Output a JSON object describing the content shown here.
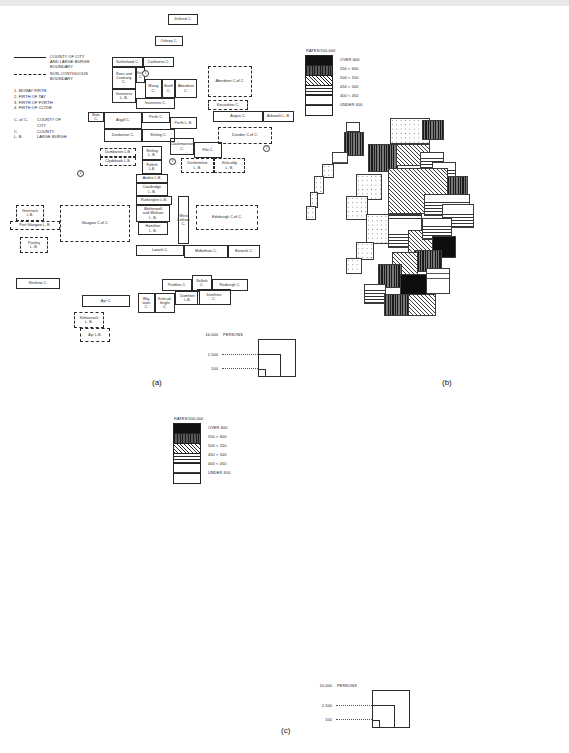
{
  "figure": {
    "panels": [
      {
        "id": "a",
        "caption": "(a)"
      },
      {
        "id": "b",
        "caption": "(b)"
      },
      {
        "id": "c",
        "caption": "(c)"
      }
    ]
  },
  "legend_boundaries": {
    "rows": [
      {
        "style": "solid",
        "text": "COUNTY OF CITY\nAND LARGE BURGH\nBOUNDARY"
      },
      {
        "style": "dashed",
        "text": "NON-CONTIGUOUS\nBOUNDARY"
      }
    ],
    "numbered": [
      "1. MORAY FIRTH",
      "2. FIRTH OF TAY",
      "3. FIRTH OF FORTH",
      "4. FIRTH OF CLYDE"
    ],
    "abbreviations": [
      {
        "abbr": "C. of C.",
        "meaning": "COUNTY OF\nCITY"
      },
      {
        "abbr": "C.",
        "meaning": "COUNTY."
      },
      {
        "abbr": "L. B.",
        "meaning": "LARGE BURGH"
      }
    ]
  },
  "rates_legend": {
    "title": "RATES/100,000",
    "classes": [
      {
        "label": "OVER 600",
        "pattern": "solid-black",
        "swatch_class": "p-over600"
      },
      {
        "label": "550 < 600",
        "pattern": "dense-vertical",
        "swatch_class": "p-550"
      },
      {
        "label": "500 < 550",
        "pattern": "diagonal-hatch",
        "swatch_class": "p-500"
      },
      {
        "label": "450 < 500",
        "pattern": "horizontal-lines",
        "swatch_class": "p-450"
      },
      {
        "label": "400 < 450",
        "pattern": "sparse-horizontal",
        "swatch_class": "p-400"
      },
      {
        "label": "UNDER 400",
        "pattern": "stipple-dots",
        "swatch_class": "p-under"
      }
    ]
  },
  "persons_scale": {
    "labels": [
      "10,000",
      "2,500",
      "100"
    ],
    "unit": "PERSONS"
  },
  "miles_scale": {
    "min": "0",
    "max": "30",
    "unit": "MILES"
  },
  "counties": [
    {
      "name": "Zetland C.",
      "x": 168,
      "y": 14,
      "w": 30,
      "h": 11,
      "style": "solid"
    },
    {
      "name": "Orkney C.",
      "x": 155,
      "y": 36,
      "w": 28,
      "h": 10,
      "style": "solid"
    },
    {
      "name": "Sutherland C.",
      "x": 112,
      "y": 57,
      "w": 31,
      "h": 10,
      "style": "solid"
    },
    {
      "name": "Caithness C.",
      "x": 143,
      "y": 57,
      "w": 31,
      "h": 10,
      "style": "solid"
    },
    {
      "name": "Ross and\nCromarty\nC.",
      "x": 112,
      "y": 67,
      "w": 24,
      "h": 22,
      "style": "solid"
    },
    {
      "name": "Inverness\nL. B.",
      "x": 112,
      "y": 89,
      "w": 24,
      "h": 14,
      "style": "solid"
    },
    {
      "name": "Nairn\nC.",
      "x": 136,
      "y": 67,
      "w": 9,
      "h": 16,
      "style": "solid"
    },
    {
      "name": "Moray\nC.",
      "x": 145,
      "y": 79,
      "w": 17,
      "h": 19,
      "style": "solid"
    },
    {
      "name": "Banff\nC.",
      "x": 162,
      "y": 79,
      "w": 13,
      "h": 19,
      "style": "solid"
    },
    {
      "name": "Aberdeen\nC.",
      "x": 175,
      "y": 79,
      "w": 22,
      "h": 19,
      "style": "solid"
    },
    {
      "name": "Aberdeen C.of C.",
      "x": 208,
      "y": 66,
      "w": 44,
      "h": 31,
      "style": "dashed"
    },
    {
      "name": "Inverness C.",
      "x": 136,
      "y": 98,
      "w": 39,
      "h": 11,
      "style": "solid"
    },
    {
      "name": "Kincardine  C.",
      "x": 208,
      "y": 100,
      "w": 40,
      "h": 10,
      "style": "dashed"
    },
    {
      "name": "Bute C.",
      "x": 88,
      "y": 112,
      "w": 16,
      "h": 10,
      "style": "solid"
    },
    {
      "name": "Argyll C.",
      "x": 104,
      "y": 112,
      "w": 38,
      "h": 17,
      "style": "solid"
    },
    {
      "name": "Perth C.",
      "x": 142,
      "y": 112,
      "w": 28,
      "h": 11,
      "style": "solid"
    },
    {
      "name": "Perth L. B.",
      "x": 170,
      "y": 117,
      "w": 27,
      "h": 12,
      "style": "solid"
    },
    {
      "name": "Angus  C.",
      "x": 213,
      "y": 111,
      "w": 50,
      "h": 11,
      "style": "solid"
    },
    {
      "name": "Arbroath L. B.",
      "x": 263,
      "y": 111,
      "w": 31,
      "h": 11,
      "style": "solid"
    },
    {
      "name": "Dundee  C.of C.",
      "x": 218,
      "y": 127,
      "w": 54,
      "h": 17,
      "style": "dashed"
    },
    {
      "name": "Stirling C.",
      "x": 142,
      "y": 129,
      "w": 33,
      "h": 13,
      "style": "solid"
    },
    {
      "name": "Dunbarton C.",
      "x": 104,
      "y": 129,
      "w": 38,
      "h": 13,
      "style": "solid"
    },
    {
      "name": "Clackmannan\nC.",
      "x": 170,
      "y": 138,
      "w": 24,
      "h": 17,
      "style": "solid"
    },
    {
      "name": "Fife C.",
      "x": 194,
      "y": 142,
      "w": 28,
      "h": 16,
      "style": "solid"
    },
    {
      "name": "Dumbarton L.B.",
      "x": 100,
      "y": 148,
      "w": 36,
      "h": 9,
      "style": "dashed"
    },
    {
      "name": "Stirling\nL. B.",
      "x": 142,
      "y": 146,
      "w": 20,
      "h": 14,
      "style": "solid"
    },
    {
      "name": "Clydebank L.B.",
      "x": 100,
      "y": 157,
      "w": 36,
      "h": 9,
      "style": "dashed"
    },
    {
      "name": "Falkirk\nL.B.",
      "x": 142,
      "y": 160,
      "w": 20,
      "h": 14,
      "style": "solid"
    },
    {
      "name": "Dunfermline\nL. B.",
      "x": 181,
      "y": 158,
      "w": 33,
      "h": 15,
      "style": "dashed"
    },
    {
      "name": "Kirkcaldy\nL. B.",
      "x": 214,
      "y": 158,
      "w": 31,
      "h": 15,
      "style": "dashed"
    },
    {
      "name": "Airdrie L.B.",
      "x": 136,
      "y": 174,
      "w": 32,
      "h": 9,
      "style": "solid"
    },
    {
      "name": "Coatbridge\nL. B.",
      "x": 136,
      "y": 183,
      "w": 32,
      "h": 13,
      "style": "solid"
    },
    {
      "name": "Rutherglen L.B.",
      "x": 136,
      "y": 196,
      "w": 36,
      "h": 9,
      "style": "solid"
    },
    {
      "name": "Motherwell\nand Wishaw\nL. B.",
      "x": 136,
      "y": 205,
      "w": 34,
      "h": 17,
      "style": "solid"
    },
    {
      "name": "Hamilton\nL. B.",
      "x": 138,
      "y": 222,
      "w": 30,
      "h": 13,
      "style": "solid"
    },
    {
      "name": "Greenock\nL.B.",
      "x": 16,
      "y": 205,
      "w": 28,
      "h": 16,
      "style": "dashed"
    },
    {
      "name": "Port Glasgow L. B.",
      "x": 10,
      "y": 221,
      "w": 50,
      "h": 9,
      "style": "dashed"
    },
    {
      "name": "Paisley\nL. B.",
      "x": 20,
      "y": 237,
      "w": 28,
      "h": 16,
      "style": "dashed"
    },
    {
      "name": "Glasgow C.of C.",
      "x": 60,
      "y": 205,
      "w": 70,
      "h": 37,
      "style": "dashed"
    },
    {
      "name": "Edinburgh C.of C.",
      "x": 196,
      "y": 205,
      "w": 62,
      "h": 25,
      "style": "dashed"
    },
    {
      "name": "West Lothian C.",
      "x": 178,
      "y": 196,
      "w": 11,
      "h": 48,
      "style": "solid"
    },
    {
      "name": "Lanark C.",
      "x": 136,
      "y": 245,
      "w": 48,
      "h": 11,
      "style": "solid"
    },
    {
      "name": "Midlothian C.",
      "x": 184,
      "y": 245,
      "w": 44,
      "h": 13,
      "style": "solid"
    },
    {
      "name": "Berwick C.",
      "x": 228,
      "y": 245,
      "w": 32,
      "h": 13,
      "style": "solid"
    },
    {
      "name": "Renfrew C.",
      "x": 16,
      "y": 278,
      "w": 44,
      "h": 11,
      "style": "solid"
    },
    {
      "name": "Peebles  C.",
      "x": 162,
      "y": 279,
      "w": 30,
      "h": 12,
      "style": "solid"
    },
    {
      "name": "Selkirk\nC.",
      "x": 192,
      "y": 275,
      "w": 20,
      "h": 16,
      "style": "solid"
    },
    {
      "name": "Roxburgh C.",
      "x": 212,
      "y": 279,
      "w": 36,
      "h": 12,
      "style": "solid"
    },
    {
      "name": "Ayr C.",
      "x": 82,
      "y": 295,
      "w": 48,
      "h": 12,
      "style": "solid"
    },
    {
      "name": "Wig-\ntown\nC.",
      "x": 138,
      "y": 293,
      "w": 17,
      "h": 20,
      "style": "solid"
    },
    {
      "name": "Kirkcud-\nbright\nC.",
      "x": 155,
      "y": 293,
      "w": 20,
      "h": 20,
      "style": "solid"
    },
    {
      "name": "Dumfries\nL.B.",
      "x": 175,
      "y": 291,
      "w": 25,
      "h": 14,
      "style": "solid"
    },
    {
      "name": "Dumfries\nC.",
      "x": 197,
      "y": 289,
      "w": 34,
      "h": 16,
      "style": "solid"
    },
    {
      "name": "Kilmarnock\nL. B.",
      "x": 74,
      "y": 312,
      "w": 30,
      "h": 16,
      "style": "dashed"
    },
    {
      "name": "Ayr L.B.",
      "x": 80,
      "y": 328,
      "w": 30,
      "h": 14,
      "style": "dashed"
    }
  ],
  "firth_markers": [
    {
      "n": "1",
      "x": 142,
      "y": 70
    },
    {
      "n": "2",
      "x": 263,
      "y": 145
    },
    {
      "n": "3",
      "x": 169,
      "y": 158
    },
    {
      "n": "4",
      "x": 77,
      "y": 170
    }
  ],
  "map_b": {
    "regions": [
      {
        "x": 54,
        "y": 4,
        "w": 14,
        "h": 26,
        "cls": "f-450"
      },
      {
        "x": 52,
        "y": 14,
        "w": 20,
        "h": 24,
        "cls": "f-550"
      },
      {
        "x": 40,
        "y": 34,
        "w": 16,
        "h": 12,
        "cls": "f-400"
      },
      {
        "x": 30,
        "y": 46,
        "w": 12,
        "h": 14,
        "cls": "f-under"
      },
      {
        "x": 22,
        "y": 58,
        "w": 10,
        "h": 18,
        "cls": "f-under"
      },
      {
        "x": 18,
        "y": 74,
        "w": 8,
        "h": 16,
        "cls": "f-under"
      },
      {
        "x": 14,
        "y": 88,
        "w": 10,
        "h": 14,
        "cls": "f-under"
      },
      {
        "x": 98,
        "y": 0,
        "w": 40,
        "h": 26,
        "cls": "f-under"
      },
      {
        "x": 130,
        "y": 2,
        "w": 22,
        "h": 20,
        "cls": "f-550"
      },
      {
        "x": 76,
        "y": 26,
        "w": 30,
        "h": 28,
        "cls": "f-550"
      },
      {
        "x": 104,
        "y": 26,
        "w": 34,
        "h": 22,
        "cls": "f-500"
      },
      {
        "x": 128,
        "y": 34,
        "w": 24,
        "h": 20,
        "cls": "f-450"
      },
      {
        "x": 140,
        "y": 44,
        "w": 24,
        "h": 22,
        "cls": "f-450"
      },
      {
        "x": 150,
        "y": 58,
        "w": 26,
        "h": 20,
        "cls": "f-550"
      },
      {
        "x": 96,
        "y": 50,
        "w": 60,
        "h": 46,
        "cls": "f-500"
      },
      {
        "x": 132,
        "y": 76,
        "w": 46,
        "h": 22,
        "cls": "f-450"
      },
      {
        "x": 150,
        "y": 86,
        "w": 32,
        "h": 24,
        "cls": "f-450"
      },
      {
        "x": 64,
        "y": 56,
        "w": 26,
        "h": 26,
        "cls": "f-under"
      },
      {
        "x": 54,
        "y": 78,
        "w": 22,
        "h": 24,
        "cls": "f-under"
      },
      {
        "x": 74,
        "y": 96,
        "w": 34,
        "h": 30,
        "cls": "f-under"
      },
      {
        "x": 96,
        "y": 96,
        "w": 34,
        "h": 34,
        "cls": "f-450"
      },
      {
        "x": 116,
        "y": 112,
        "w": 32,
        "h": 28,
        "cls": "f-500"
      },
      {
        "x": 130,
        "y": 100,
        "w": 30,
        "h": 22,
        "cls": "f-450"
      },
      {
        "x": 140,
        "y": 118,
        "w": 24,
        "h": 22,
        "cls": "f-over600"
      },
      {
        "x": 122,
        "y": 132,
        "w": 28,
        "h": 22,
        "cls": "f-550"
      },
      {
        "x": 100,
        "y": 134,
        "w": 26,
        "h": 26,
        "cls": "f-500"
      },
      {
        "x": 86,
        "y": 146,
        "w": 24,
        "h": 24,
        "cls": "f-550"
      },
      {
        "x": 108,
        "y": 156,
        "w": 32,
        "h": 26,
        "cls": "f-over600"
      },
      {
        "x": 134,
        "y": 150,
        "w": 24,
        "h": 26,
        "cls": "f-400"
      },
      {
        "x": 64,
        "y": 124,
        "w": 18,
        "h": 18,
        "cls": "f-under"
      },
      {
        "x": 54,
        "y": 140,
        "w": 16,
        "h": 16,
        "cls": "f-under"
      },
      {
        "x": 72,
        "y": 166,
        "w": 22,
        "h": 20,
        "cls": "f-450"
      },
      {
        "x": 92,
        "y": 176,
        "w": 26,
        "h": 22,
        "cls": "f-550"
      },
      {
        "x": 116,
        "y": 176,
        "w": 28,
        "h": 22,
        "cls": "f-500"
      }
    ]
  },
  "cartogram_c": {
    "regions": [
      {
        "x": 140,
        "y": 2,
        "w": 18,
        "h": 12,
        "cls": "f-450"
      },
      {
        "x": 126,
        "y": 20,
        "w": 20,
        "h": 10,
        "cls": "f-500"
      },
      {
        "x": 114,
        "y": 28,
        "w": 18,
        "h": 10,
        "cls": "f-450"
      },
      {
        "x": 104,
        "y": 38,
        "w": 50,
        "h": 16,
        "cls": "f-450"
      },
      {
        "x": 100,
        "y": 44,
        "w": 34,
        "h": 20,
        "cls": "f-550"
      },
      {
        "x": 150,
        "y": 42,
        "w": 26,
        "h": 20,
        "cls": "f-over600"
      },
      {
        "x": 134,
        "y": 52,
        "w": 52,
        "h": 18,
        "cls": "f-450"
      },
      {
        "x": 184,
        "y": 48,
        "w": 34,
        "h": 14,
        "cls": "f-450"
      },
      {
        "x": 180,
        "y": 60,
        "w": 28,
        "h": 12,
        "cls": "f-500"
      },
      {
        "x": 96,
        "y": 60,
        "w": 34,
        "h": 16,
        "cls": "f-under"
      },
      {
        "x": 72,
        "y": 66,
        "w": 28,
        "h": 16,
        "cls": "f-450"
      },
      {
        "x": 108,
        "y": 72,
        "w": 46,
        "h": 16,
        "cls": "f-450"
      },
      {
        "x": 142,
        "y": 74,
        "w": 40,
        "h": 16,
        "cls": "f-500"
      },
      {
        "x": 172,
        "y": 68,
        "w": 40,
        "h": 14,
        "cls": "f-450"
      },
      {
        "x": 196,
        "y": 64,
        "w": 26,
        "h": 14,
        "cls": "f-550"
      },
      {
        "x": 84,
        "y": 84,
        "w": 56,
        "h": 16,
        "cls": "f-450"
      },
      {
        "x": 136,
        "y": 84,
        "w": 28,
        "h": 22,
        "cls": "f-500"
      },
      {
        "x": 158,
        "y": 82,
        "w": 28,
        "h": 20,
        "cls": "f-550"
      },
      {
        "x": 180,
        "y": 84,
        "w": 48,
        "h": 16,
        "cls": "f-450"
      },
      {
        "x": 94,
        "y": 100,
        "w": 42,
        "h": 16,
        "cls": "f-over600"
      },
      {
        "x": 146,
        "y": 98,
        "w": 34,
        "h": 14,
        "cls": "f-over600"
      },
      {
        "x": 176,
        "y": 100,
        "w": 52,
        "h": 16,
        "cls": "f-450"
      },
      {
        "x": 86,
        "y": 110,
        "w": 56,
        "h": 18,
        "cls": "f-500"
      },
      {
        "x": 140,
        "y": 110,
        "w": 44,
        "h": 18,
        "cls": "f-500"
      },
      {
        "x": 186,
        "y": 110,
        "w": 56,
        "h": 18,
        "cls": "f-500"
      },
      {
        "x": 30,
        "y": 126,
        "w": 110,
        "h": 108,
        "cls": "f-over600"
      },
      {
        "x": 138,
        "y": 124,
        "w": 40,
        "h": 26,
        "cls": "f-550"
      },
      {
        "x": 178,
        "y": 122,
        "w": 36,
        "h": 22,
        "cls": "f-450"
      },
      {
        "x": 208,
        "y": 120,
        "w": 56,
        "h": 38,
        "cls": "f-500"
      },
      {
        "x": 140,
        "y": 146,
        "w": 44,
        "h": 22,
        "cls": "f-450"
      },
      {
        "x": 178,
        "y": 146,
        "w": 46,
        "h": 22,
        "cls": "f-400"
      },
      {
        "x": 0,
        "y": 150,
        "w": 34,
        "h": 18,
        "cls": "f-400"
      },
      {
        "x": 4,
        "y": 164,
        "w": 30,
        "h": 18,
        "cls": "f-450"
      },
      {
        "x": 14,
        "y": 180,
        "w": 22,
        "h": 50,
        "cls": "f-550"
      },
      {
        "x": 140,
        "y": 166,
        "w": 36,
        "h": 26,
        "cls": "f-550"
      },
      {
        "x": 170,
        "y": 160,
        "w": 58,
        "h": 42,
        "cls": "f-500"
      },
      {
        "x": 214,
        "y": 156,
        "w": 48,
        "h": 48,
        "cls": "f-500"
      },
      {
        "x": 98,
        "y": 186,
        "w": 52,
        "h": 46,
        "cls": "f-over600"
      },
      {
        "x": 142,
        "y": 190,
        "w": 42,
        "h": 44,
        "cls": "f-550"
      },
      {
        "x": 176,
        "y": 196,
        "w": 48,
        "h": 38,
        "cls": "f-450"
      },
      {
        "x": 30,
        "y": 226,
        "w": 48,
        "h": 22,
        "cls": "f-500"
      },
      {
        "x": 74,
        "y": 228,
        "w": 60,
        "h": 20,
        "cls": "f-550"
      },
      {
        "x": 126,
        "y": 228,
        "w": 42,
        "h": 22,
        "cls": "f-500"
      },
      {
        "x": 160,
        "y": 222,
        "w": 54,
        "h": 26,
        "cls": "f-450"
      },
      {
        "x": 96,
        "y": 246,
        "w": 38,
        "h": 18,
        "cls": "f-550"
      },
      {
        "x": 130,
        "y": 244,
        "w": 46,
        "h": 16,
        "cls": "f-450"
      }
    ]
  }
}
